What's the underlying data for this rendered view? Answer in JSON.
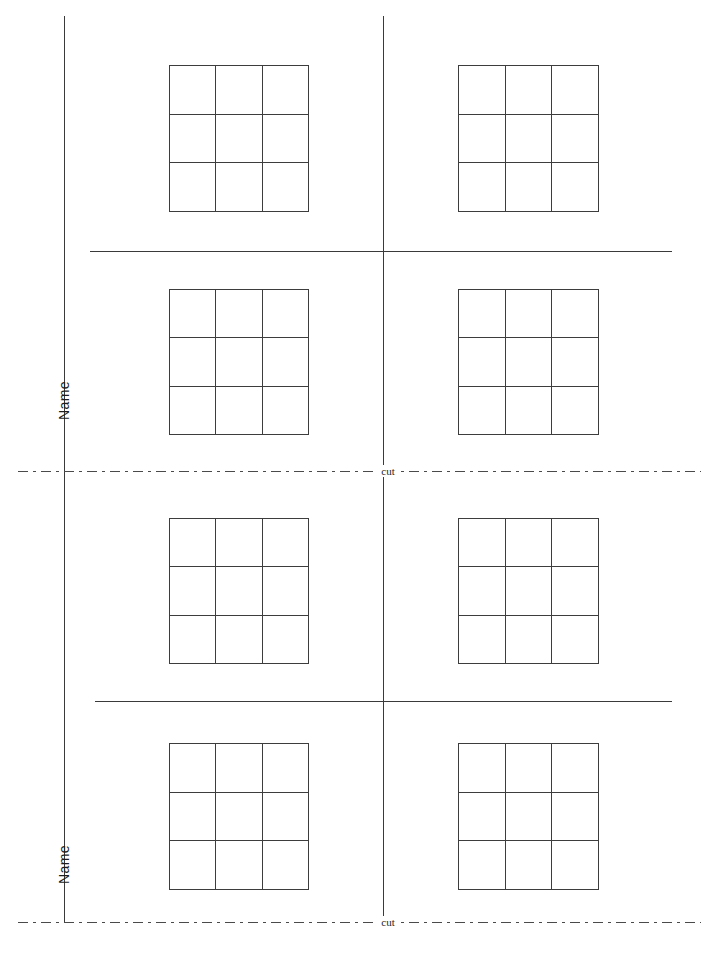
{
  "page": {
    "width": 705,
    "height": 961,
    "background_color": "#ffffff",
    "line_color": "#3d3d3d",
    "cut_line_color": "#4a4a4a",
    "text_color": "#1d1d1d"
  },
  "name_labels": [
    {
      "text": "Name",
      "x": 56,
      "y": 420,
      "rotation_deg": -90
    },
    {
      "text": "Name",
      "x": 56,
      "y": 884,
      "rotation_deg": -90
    }
  ],
  "cut_lines": [
    {
      "label": "cut",
      "y": 471,
      "x_start": 18,
      "x_end": 701,
      "label_x": 388
    },
    {
      "label": "cut",
      "y": 922,
      "x_start": 18,
      "x_end": 701,
      "label_x": 388
    }
  ],
  "vertical_rules": [
    {
      "x": 64,
      "y_start": 16,
      "y_end": 471
    },
    {
      "x": 64,
      "y_start": 471,
      "y_end": 922
    },
    {
      "x": 383,
      "y_start": 16,
      "y_end": 471
    },
    {
      "x": 383,
      "y_start": 471,
      "y_end": 922
    }
  ],
  "horizontal_rules": [
    {
      "y": 251,
      "x_start": 90,
      "x_end": 672
    },
    {
      "y": 701,
      "x_start": 95,
      "x_end": 672
    }
  ],
  "grids": [
    {
      "id": "grid-1",
      "rows": 3,
      "cols": 3,
      "x": 169,
      "y": 65,
      "width": 140,
      "height": 147,
      "section": "top",
      "column": "left"
    },
    {
      "id": "grid-2",
      "rows": 3,
      "cols": 3,
      "x": 458,
      "y": 65,
      "width": 141,
      "height": 147,
      "section": "top",
      "column": "right"
    },
    {
      "id": "grid-3",
      "rows": 3,
      "cols": 3,
      "x": 169,
      "y": 289,
      "width": 140,
      "height": 146,
      "section": "second",
      "column": "left"
    },
    {
      "id": "grid-4",
      "rows": 3,
      "cols": 3,
      "x": 458,
      "y": 289,
      "width": 141,
      "height": 146,
      "section": "second",
      "column": "right"
    },
    {
      "id": "grid-5",
      "rows": 3,
      "cols": 3,
      "x": 169,
      "y": 518,
      "width": 140,
      "height": 146,
      "section": "third",
      "column": "left"
    },
    {
      "id": "grid-6",
      "rows": 3,
      "cols": 3,
      "x": 458,
      "y": 518,
      "width": 141,
      "height": 146,
      "section": "third",
      "column": "right"
    },
    {
      "id": "grid-7",
      "rows": 3,
      "cols": 3,
      "x": 169,
      "y": 743,
      "width": 140,
      "height": 147,
      "section": "fourth",
      "column": "left"
    },
    {
      "id": "grid-8",
      "rows": 3,
      "cols": 3,
      "x": 458,
      "y": 743,
      "width": 141,
      "height": 147,
      "section": "fourth",
      "column": "right"
    }
  ]
}
